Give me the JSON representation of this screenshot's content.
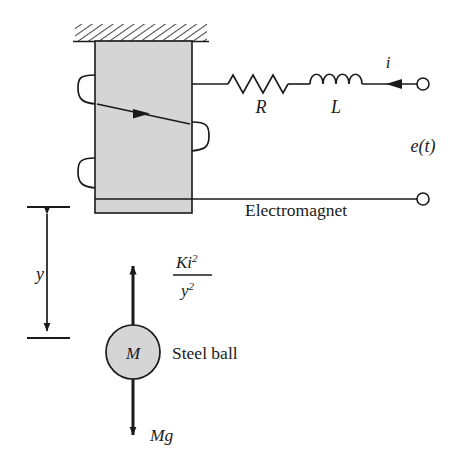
{
  "figure": {
    "type": "schematic-diagram"
  },
  "colors": {
    "stroke": "#1a1a1a",
    "core_fill": "#d5d5d5",
    "ball_fill": "#d5d5d5",
    "hatch_line": "#4a4a4a",
    "background": "#ffffff"
  },
  "labels": {
    "resistor": "R",
    "inductor": "L",
    "current": "i",
    "source_voltage": "e(t)",
    "electromagnet": "Electromagnet",
    "steel_ball": "Steel ball",
    "ball_mass": "M",
    "gap_distance": "y",
    "magnetic_force_numerator": "Ki",
    "magnetic_force_numerator_exp": "2",
    "magnetic_force_denominator": "y",
    "magnetic_force_denominator_exp": "2",
    "weight_force": "Mg"
  },
  "components": {
    "ceiling": {
      "name": "hatched-ceiling",
      "x": 75,
      "y": 24,
      "width": 132,
      "height": 17
    },
    "core": {
      "name": "electromagnet-core",
      "x": 95,
      "y": 41,
      "width": 97,
      "height": 172
    },
    "resistor": {
      "name": "resistor-symbol",
      "peaks": 5,
      "x_start": 228,
      "x_end": 288,
      "y": 84
    },
    "inductor": {
      "name": "inductor-symbol",
      "loops": 4,
      "x_start": 310,
      "x_end": 362,
      "y": 84
    },
    "terminal_top": {
      "name": "top-terminal-node",
      "cx": 423,
      "cy": 84,
      "r": 6
    },
    "terminal_bottom": {
      "name": "bottom-terminal-node",
      "cx": 423,
      "cy": 199,
      "r": 6
    },
    "ball": {
      "name": "steel-ball",
      "cx": 133,
      "cy": 352,
      "r": 27
    },
    "force_up_arrow": {
      "name": "magnetic-force-arrow",
      "x": 133,
      "y_tail": 325,
      "y_head": 264
    },
    "force_down_arrow": {
      "name": "weight-force-arrow",
      "x": 133,
      "y_tail": 379,
      "y_head": 437
    },
    "dimension_line": {
      "name": "gap-dimension-arrow",
      "x": 47,
      "y_top": 207,
      "y_bottom": 338
    }
  }
}
